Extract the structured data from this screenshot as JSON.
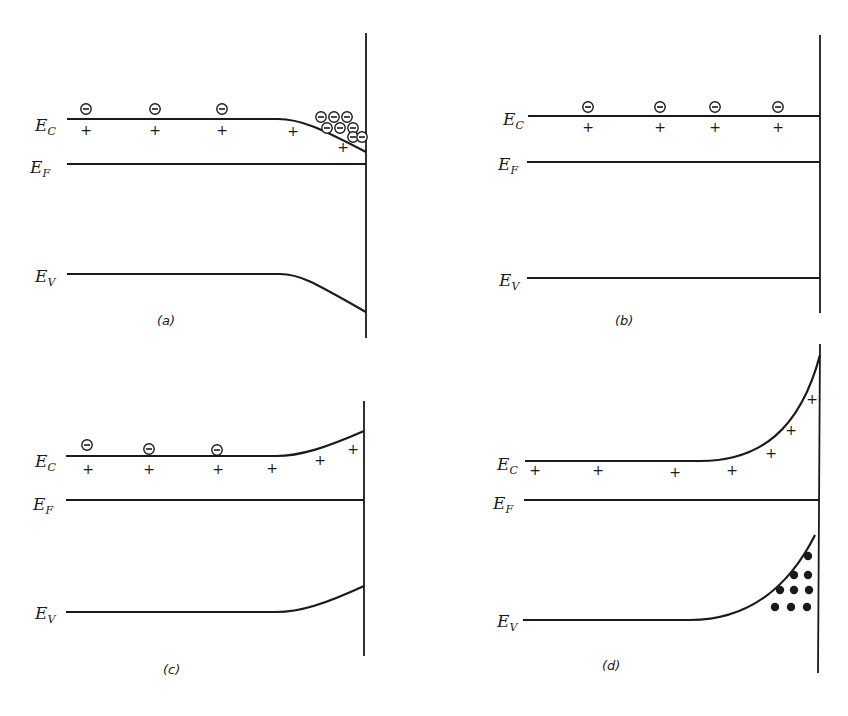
{
  "figure": {
    "colors": {
      "ink": "#1a1a1a",
      "paper": "#ffffff"
    },
    "labels": {
      "conduction": {
        "main": "E",
        "sub": "C"
      },
      "fermi": {
        "main": "E",
        "sub": "F"
      },
      "valence": {
        "main": "E",
        "sub": "V"
      }
    },
    "symbols": {
      "electron": "negative-charge-circle",
      "donor": "+",
      "hole": "filled-dot"
    }
  },
  "panels": [
    {
      "id": "a",
      "caption": "(a)",
      "bending": "downward",
      "electrons": [
        [
          86,
          109
        ],
        [
          155,
          109
        ],
        [
          222,
          109
        ],
        [
          321,
          117
        ],
        [
          334,
          117
        ],
        [
          347,
          117
        ],
        [
          327,
          128
        ],
        [
          340,
          128
        ],
        [
          353,
          128
        ],
        [
          353,
          137
        ],
        [
          362,
          137
        ]
      ],
      "donors": [
        [
          86,
          130
        ],
        [
          155,
          130
        ],
        [
          222,
          130
        ],
        [
          293,
          131
        ],
        [
          343,
          147
        ]
      ],
      "holes": []
    },
    {
      "id": "b",
      "caption": "(b)",
      "bending": "flat",
      "electrons": [
        [
          588,
          107
        ],
        [
          660,
          107
        ],
        [
          715,
          107
        ],
        [
          778,
          107
        ]
      ],
      "donors": [
        [
          588,
          127
        ],
        [
          660,
          127
        ],
        [
          715,
          127
        ],
        [
          778,
          127
        ]
      ],
      "holes": []
    },
    {
      "id": "c",
      "caption": "(c)",
      "bending": "upward-depletion",
      "electrons": [
        [
          87,
          445
        ],
        [
          149,
          449
        ],
        [
          217,
          450
        ]
      ],
      "donors": [
        [
          88,
          469
        ],
        [
          149,
          469
        ],
        [
          218,
          469
        ],
        [
          272,
          468
        ],
        [
          320,
          460
        ],
        [
          353,
          449
        ]
      ],
      "holes": []
    },
    {
      "id": "d",
      "caption": "(d)",
      "bending": "upward-inversion",
      "electrons": [],
      "donors": [
        [
          535,
          470
        ],
        [
          598,
          470
        ],
        [
          675,
          472
        ],
        [
          732,
          470
        ],
        [
          771,
          453
        ],
        [
          791,
          430
        ],
        [
          812,
          399
        ]
      ],
      "holes": [
        [
          808,
          556
        ],
        [
          794,
          575
        ],
        [
          808,
          575
        ],
        [
          780,
          590
        ],
        [
          794,
          590
        ],
        [
          809,
          590
        ],
        [
          775,
          607
        ],
        [
          791,
          607
        ],
        [
          807,
          607
        ]
      ]
    }
  ]
}
